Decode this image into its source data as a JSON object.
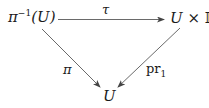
{
  "diagram": {
    "type": "commutative-triangle",
    "nodes": {
      "top_left": {
        "base": "π",
        "sup": "−1",
        "arg": "(U)"
      },
      "top_right": {
        "left": "U",
        "op": "×",
        "right": "𝔽"
      },
      "bottom": {
        "text": "U"
      }
    },
    "arrows": {
      "top": {
        "label": "τ",
        "from": "top_left",
        "to": "top_right"
      },
      "left": {
        "label": "π",
        "from": "top_left",
        "to": "bottom"
      },
      "right": {
        "label_base": "pr",
        "label_sub": "1",
        "from": "top_right",
        "to": "bottom"
      }
    },
    "colors": {
      "stroke": "#444444",
      "text": "#1a1a1a"
    }
  }
}
